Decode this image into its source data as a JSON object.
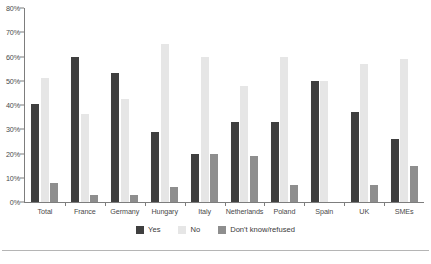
{
  "chart_data": {
    "type": "bar",
    "title": "",
    "subtitle": "",
    "xlabel": "",
    "ylabel": "",
    "ylim": [
      0,
      80
    ],
    "ytick_labels": [
      "0%",
      "10%",
      "20%",
      "30%",
      "40%",
      "50%",
      "60%",
      "70%",
      "80%"
    ],
    "ytick_values": [
      0,
      10,
      20,
      30,
      40,
      50,
      60,
      70,
      80
    ],
    "grid": false,
    "legend_position": "bottom",
    "categories": [
      "Total",
      "France",
      "Germany",
      "Hungary",
      "Italy",
      "Netherlands",
      "Poland",
      "Spain",
      "UK",
      "SMEs"
    ],
    "series": [
      {
        "name": "Yes",
        "color": "#3f3f3f",
        "values": [
          40.5,
          60,
          53,
          29,
          20,
          33,
          33,
          50,
          37,
          26
        ]
      },
      {
        "name": "No",
        "color": "#e6e6e6",
        "values": [
          51,
          36.5,
          42.5,
          65,
          60,
          48,
          60,
          50,
          57,
          59
        ]
      },
      {
        "name": "Don't know/refused",
        "color": "#8e8e8e",
        "values": [
          8,
          3,
          3,
          6,
          20,
          19,
          7,
          0,
          7,
          15
        ]
      }
    ]
  },
  "legend": {
    "items": [
      {
        "label": "Yes",
        "color": "#3f3f3f"
      },
      {
        "label": "No",
        "color": "#e6e6e6"
      },
      {
        "label": "Don't know/refused",
        "color": "#8e8e8e"
      }
    ]
  }
}
